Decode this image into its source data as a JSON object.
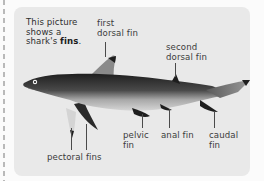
{
  "intro": {
    "line1": "This picture",
    "line2": "shows a",
    "line3_prefix": "shark's ",
    "line3_bold": "fins",
    "line3_suffix": "."
  },
  "labels": {
    "first_dorsal": [
      "first",
      "dorsal fin"
    ],
    "second_dorsal": [
      "second",
      "dorsal fin"
    ],
    "pectoral": "pectoral fins",
    "pelvic": [
      "pelvic",
      "fin"
    ],
    "anal": "anal fin",
    "caudal": [
      "caudal",
      "fin"
    ]
  },
  "colors": {
    "card_background": "#e9e9e9",
    "page_background": "#fbfbfb",
    "text": "#3b3b3b",
    "shark_dark": "#2a2a2a",
    "shark_light": "#bdbdbd"
  }
}
